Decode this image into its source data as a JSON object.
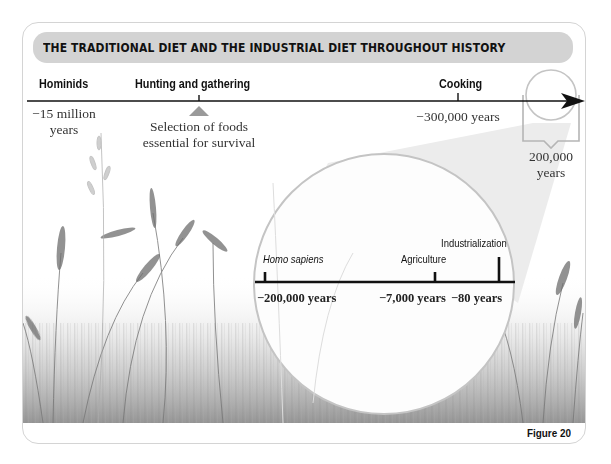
{
  "header": {
    "title": "THE TRADITIONAL DIET AND THE INDUSTRIAL DIET THROUGHOUT HISTORY"
  },
  "main_timeline": {
    "events": [
      {
        "label": "Hominids",
        "date": "−15 million",
        "date_line2": "years"
      },
      {
        "label": "Hunting and gathering",
        "note_line1": "Selection of foods",
        "note_line2": "essential for survival"
      },
      {
        "label": "Cooking",
        "date": "−300,000 years"
      }
    ],
    "zoom_callout": {
      "line1": "200,000",
      "line2": "years"
    }
  },
  "zoomed_timeline": {
    "events": [
      {
        "label": "Homo sapiens",
        "date": "−200,000 years",
        "italic": true
      },
      {
        "label": "Agriculture",
        "date": "−7,000 years"
      },
      {
        "label": "Industrialization",
        "date": "−80 years"
      }
    ]
  },
  "footer": {
    "figure_label": "Figure 20"
  },
  "colors": {
    "header_bg": "#d3d3d3",
    "frame_border": "#d4d4d4",
    "cone": "#ececec",
    "circle_stroke": "#c4c4c4",
    "triangle": "#9a9a9a",
    "line": "#111111"
  }
}
